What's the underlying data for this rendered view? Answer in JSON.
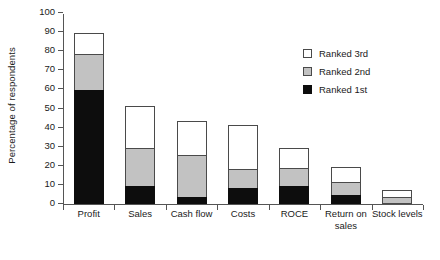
{
  "chart_data": {
    "type": "bar",
    "subtype": "stacked-bar",
    "title": "",
    "xlabel": "",
    "ylabel": "Percentage of respondents",
    "ylim": [
      0,
      100
    ],
    "yticks": [
      0,
      10,
      20,
      30,
      40,
      50,
      60,
      70,
      80,
      90,
      100
    ],
    "grid": false,
    "legend_position": "upper right",
    "categories": [
      "Profit",
      "Sales",
      "Cash flow",
      "Costs",
      "ROCE",
      "Return on\nsales",
      "Stock levels"
    ],
    "series": [
      {
        "name": "Ranked 1st",
        "color": "#0d0d0d",
        "values": [
          59,
          9,
          3,
          8,
          9,
          4,
          0
        ]
      },
      {
        "name": "Ranked 2nd",
        "color": "#c2c2c2",
        "values": [
          19,
          20,
          22,
          10,
          9.5,
          7,
          3
        ]
      },
      {
        "name": "Ranked 3rd",
        "color": "#ffffff",
        "values": [
          11,
          22,
          18,
          23,
          10.5,
          8,
          4
        ]
      }
    ],
    "totals": [
      89,
      51,
      43,
      41,
      29,
      19,
      7
    ]
  }
}
